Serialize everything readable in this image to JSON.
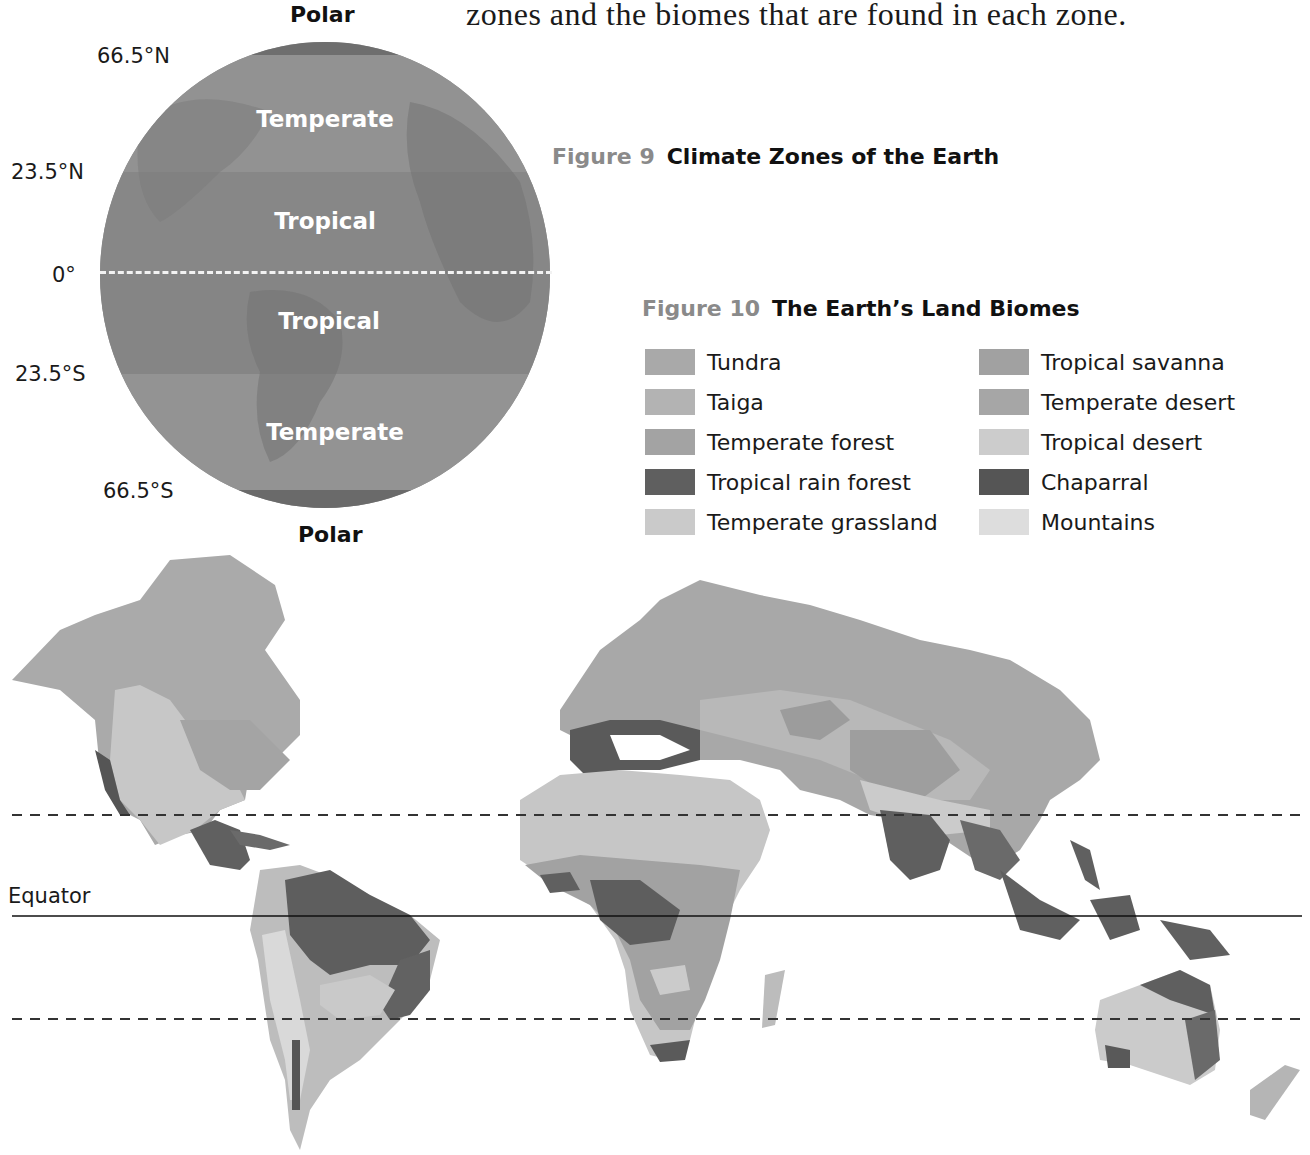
{
  "intro_text": "zones and the biomes that are found in each zone.",
  "figure9": {
    "number": "Figure 9",
    "title": "Climate Zones of the Earth",
    "pole_labels": {
      "north": "Polar",
      "south": "Polar"
    },
    "latitude_labels": [
      "66.5°N",
      "23.5°N",
      "0°",
      "23.5°S",
      "66.5°S"
    ],
    "zones": [
      "Temperate",
      "Tropical",
      "Tropical",
      "Temperate"
    ],
    "colors": {
      "polar": "#6e6e6e",
      "temperate": "#8e8e8e",
      "tropical": "#858585",
      "equator_line": "#f2f2f2"
    }
  },
  "figure10": {
    "number": "Figure 10",
    "title": "The Earth’s Land Biomes",
    "legend": [
      {
        "label": "Tundra",
        "color": "#a9a9a9"
      },
      {
        "label": "Taiga",
        "color": "#b3b3b3"
      },
      {
        "label": "Temperate forest",
        "color": "#a3a3a3"
      },
      {
        "label": "Tropical rain forest",
        "color": "#5f5f5f"
      },
      {
        "label": "Temperate grassland",
        "color": "#cacaca"
      },
      {
        "label": "Tropical savanna",
        "color": "#a1a1a1"
      },
      {
        "label": "Temperate desert",
        "color": "#a6a6a6"
      },
      {
        "label": "Tropical desert",
        "color": "#cccccc"
      },
      {
        "label": "Chaparral",
        "color": "#555555"
      },
      {
        "label": "Mountains",
        "color": "#dddddd"
      }
    ],
    "map": {
      "equator_label": "Equator",
      "lines": {
        "tropic_of_cancer_y": 815,
        "equator_y": 916,
        "tropic_of_capricorn_y": 1019
      }
    }
  }
}
